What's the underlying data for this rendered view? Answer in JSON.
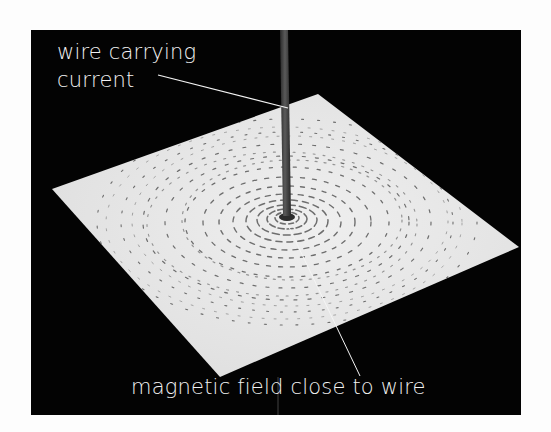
{
  "figure": {
    "background_color": "#fdfdfd",
    "frame_color": "#030303",
    "card_color": "#e8e8e8",
    "filing_color": "#6e6e6e",
    "wire_color": "#3a3a3a",
    "leader_color": "#f4f4f4"
  },
  "labels": {
    "wire_line1": "wire carrying",
    "wire_line2": "current",
    "field": "magnetic field close to wire"
  },
  "scene": {
    "card_corners": {
      "top": [
        318,
        94
      ],
      "right": [
        519,
        247
      ],
      "bottom": [
        220,
        377
      ],
      "left": [
        52,
        189
      ]
    },
    "wire": {
      "top": [
        284,
        30
      ],
      "base": [
        287,
        216
      ],
      "width": 8
    },
    "field_center": [
      287,
      218
    ]
  }
}
